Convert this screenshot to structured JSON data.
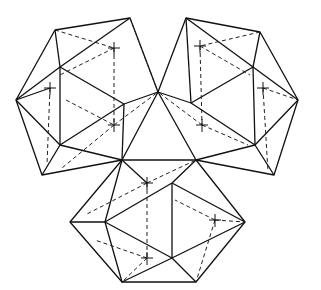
{
  "figure": {
    "title": "",
    "colors": {
      "line": "#111111",
      "background": "#ffffff"
    },
    "polyhedra": [
      {
        "name": "left",
        "center": [
          85,
          95
        ]
      },
      {
        "name": "right",
        "center": [
          232,
          95
        ]
      },
      {
        "name": "bottom",
        "center": [
          160,
          215
        ]
      }
    ]
  }
}
